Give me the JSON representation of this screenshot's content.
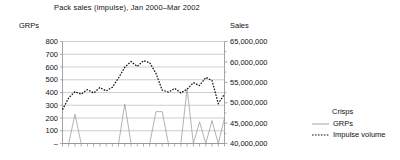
{
  "chart_data": {
    "type": "line",
    "title": "Pack sales (impulse), Jan 2000–Mar 2002",
    "xlabel": "",
    "ylabel": "GRPs",
    "y2label": "Sales",
    "grid": true,
    "legend_position": "right",
    "legend_title": "Crisps",
    "ylim": [
      0,
      800
    ],
    "y2lim": [
      40000000,
      65000000
    ],
    "yticks": [
      "–",
      "100",
      "200",
      "300",
      "400",
      "500",
      "600",
      "700",
      "800"
    ],
    "ytick_values": [
      0,
      100,
      200,
      300,
      400,
      500,
      600,
      700,
      800
    ],
    "y2ticks": [
      "40,000,000",
      "45,000,000",
      "50,000,000",
      "55,000,000",
      "60,000,000",
      "65,000,000"
    ],
    "y2tick_values": [
      40000000,
      45000000,
      50000000,
      55000000,
      60000000,
      65000000
    ],
    "x": [
      "Jan 2000",
      "Feb 2000",
      "Mar 2000",
      "Apr 2000",
      "May 2000",
      "Jun 2000",
      "Jul 2000",
      "Aug 2000",
      "Sep 2000",
      "Oct 2000",
      "Nov 2000",
      "Dec 2000",
      "Jan 2001",
      "Feb 2001",
      "Mar 2001",
      "Apr 2001",
      "May 2001",
      "Jun 2001",
      "Jul 2001",
      "Aug 2001",
      "Sep 2001",
      "Oct 2001",
      "Nov 2001",
      "Dec 2001",
      "Jan 2002",
      "Feb 2002",
      "Mar 2002"
    ],
    "series": [
      {
        "name": "GRPs",
        "axis": "left",
        "style": "solid",
        "color": "#9a9a9a",
        "values": [
          0,
          0,
          230,
          0,
          0,
          0,
          0,
          0,
          0,
          0,
          310,
          0,
          0,
          0,
          0,
          250,
          250,
          0,
          0,
          0,
          430,
          0,
          170,
          0,
          180,
          0,
          200
        ]
      },
      {
        "name": "Impulse volume",
        "axis": "right",
        "style": "dashed",
        "color": "#101010",
        "values": [
          48300000,
          51200000,
          52700000,
          52100000,
          53200000,
          52400000,
          53700000,
          52900000,
          53800000,
          56100000,
          58700000,
          60100000,
          58900000,
          60300000,
          59800000,
          57200000,
          53100000,
          52600000,
          53500000,
          52400000,
          53300000,
          54900000,
          54200000,
          56200000,
          55400000,
          49800000,
          52100000
        ]
      }
    ]
  },
  "legend": {
    "title": "Crisps",
    "items": [
      {
        "label": "GRPs",
        "style": "solid"
      },
      {
        "label": "Impulse volume",
        "style": "dashed"
      }
    ]
  }
}
